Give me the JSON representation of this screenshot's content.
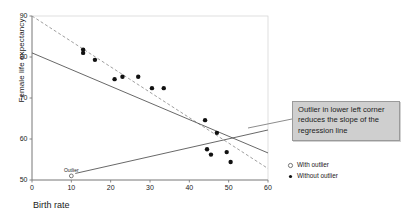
{
  "chart_data": {
    "type": "scatter",
    "title": "",
    "xlabel": "Birth rate",
    "ylabel": "Female life expectancy",
    "xlim": [
      0,
      60
    ],
    "ylim": [
      50,
      90
    ],
    "xticks": [
      0,
      10,
      20,
      30,
      40,
      50,
      60
    ],
    "yticks": [
      50,
      60,
      70,
      80,
      90
    ],
    "grid": false,
    "legend_position": "right",
    "series": [
      {
        "name": "Without outlier",
        "marker": "filled-circle",
        "points": [
          {
            "x": 13.0,
            "y": 81.8
          },
          {
            "x": 13.0,
            "y": 81.0
          },
          {
            "x": 16.0,
            "y": 79.3
          },
          {
            "x": 21.0,
            "y": 74.6
          },
          {
            "x": 23.0,
            "y": 75.2
          },
          {
            "x": 27.0,
            "y": 75.2
          },
          {
            "x": 30.5,
            "y": 72.4
          },
          {
            "x": 33.5,
            "y": 72.4
          },
          {
            "x": 44.0,
            "y": 64.6
          },
          {
            "x": 47.0,
            "y": 61.5
          },
          {
            "x": 44.5,
            "y": 57.5
          },
          {
            "x": 45.5,
            "y": 56.2
          },
          {
            "x": 49.5,
            "y": 56.8
          },
          {
            "x": 50.5,
            "y": 54.4
          }
        ]
      },
      {
        "name": "With outlier",
        "marker": "open-circle",
        "points": [
          {
            "x": 10.0,
            "y": 51.0,
            "label": "Outlier"
          }
        ]
      }
    ],
    "lines": [
      {
        "name": "regression-without-outlier",
        "style": "dashed",
        "from": {
          "x": 0,
          "y": 90.0
        },
        "to": {
          "x": 60,
          "y": 52.8
        }
      },
      {
        "name": "regression-with-outlier",
        "style": "solid",
        "from": {
          "x": 0,
          "y": 81.0
        },
        "to": {
          "x": 60,
          "y": 56.6
        }
      },
      {
        "name": "outlier-leader-line",
        "style": "solid",
        "from": {
          "x": 11.0,
          "y": 51.6
        },
        "to": {
          "x": 60,
          "y": 62.2
        }
      }
    ],
    "annotations": [
      {
        "name": "outlier-callout",
        "text": "Outlier in lower left corner reduces the slope of the regression line"
      },
      {
        "name": "outlier-point-label",
        "text": "Outlier"
      }
    ]
  },
  "axes": {
    "x": {
      "label": "Birth rate",
      "ticks": [
        "0",
        "10",
        "20",
        "30",
        "40",
        "50",
        "60"
      ]
    },
    "y": {
      "label": "Female life expectancy",
      "ticks": [
        "50",
        "60",
        "70",
        "80",
        "90"
      ]
    }
  },
  "legend": {
    "items": [
      {
        "label": "With outlier",
        "marker": "open-circle"
      },
      {
        "label": "Without outlier",
        "marker": "filled-circle"
      }
    ]
  },
  "callout": {
    "text": "Outlier in lower left corner reduces the slope of the regression line"
  },
  "point_labels": {
    "outlier": "Outlier"
  },
  "colors": {
    "axis": "#7a7a7a",
    "point": "#111111",
    "line_solid": "#4d4d4d",
    "line_dashed": "#8e8e8e",
    "callout_bg": "#cfcfcf",
    "callout_border": "#9a9a9a",
    "text": "#1a1a1a"
  }
}
